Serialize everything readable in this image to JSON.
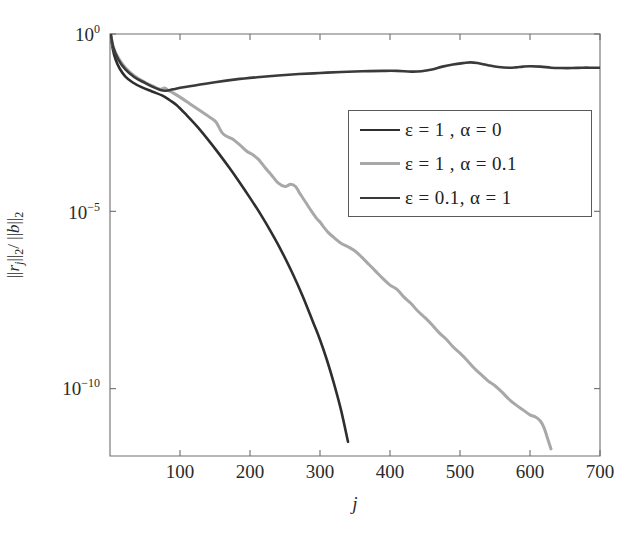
{
  "chart_data": {
    "type": "line",
    "title": "",
    "xlabel": "j",
    "ylabel": "|| r_j ||_2 / || b ||_2",
    "xlim": [
      0,
      700
    ],
    "ylim_log10": [
      -11.9,
      0
    ],
    "yscale": "log",
    "xscale": "linear",
    "grid": false,
    "legend_position": "center-right",
    "xticks": [
      "100",
      "200",
      "300",
      "400",
      "500",
      "600",
      "700"
    ],
    "xtick_values": [
      100,
      200,
      300,
      400,
      500,
      600,
      700
    ],
    "yticks": [
      "10^0",
      "10^-5",
      "10^-10"
    ],
    "ytick_exponents": [
      0,
      -5,
      -10
    ],
    "series": [
      {
        "name": "eps-1-alpha-0",
        "legend_label": "ε = 1 , α = 0",
        "color": "#2e2e2e",
        "width": 2.6,
        "x": [
          1,
          4,
          8,
          14,
          22,
          32,
          45,
          60,
          75,
          85,
          95,
          110,
          125,
          140,
          155,
          170,
          185,
          200,
          215,
          230,
          245,
          260,
          275,
          290,
          300,
          310,
          320,
          330,
          340,
          345
        ],
        "y_log10": [
          0,
          -0.42,
          -0.72,
          -0.98,
          -1.2,
          -1.36,
          -1.5,
          -1.62,
          -1.74,
          -1.86,
          -2.0,
          -2.3,
          -2.62,
          -2.98,
          -3.36,
          -3.76,
          -4.18,
          -4.62,
          -5.08,
          -5.58,
          -6.12,
          -6.72,
          -7.38,
          -8.12,
          -8.62,
          -9.2,
          -9.86,
          -10.6,
          -11.5,
          -11.95
        ]
      },
      {
        "name": "eps-1-alpha-0p1",
        "legend_label": "ε = 1 , α = 0.1",
        "color": "#a8a8a8",
        "width": 3.0,
        "x": [
          1,
          5,
          12,
          22,
          35,
          50,
          62,
          72,
          78,
          84,
          90,
          100,
          115,
          130,
          145,
          152,
          160,
          168,
          175,
          185,
          195,
          200,
          205,
          210,
          215,
          222,
          230,
          240,
          250,
          258,
          265,
          272,
          280,
          288,
          296,
          300,
          306,
          312,
          320,
          330,
          340,
          350,
          360,
          370,
          380,
          390,
          400,
          410,
          420,
          430,
          440,
          450,
          460,
          470,
          480,
          490,
          500,
          510,
          520,
          530,
          540,
          550,
          560,
          570,
          580,
          590,
          600,
          608,
          615,
          620,
          625,
          630,
          635
        ],
        "y_log10": [
          0,
          -0.38,
          -0.68,
          -0.95,
          -1.18,
          -1.36,
          -1.48,
          -1.56,
          -1.52,
          -1.6,
          -1.66,
          -1.78,
          -1.98,
          -2.18,
          -2.38,
          -2.5,
          -2.78,
          -2.9,
          -2.96,
          -3.12,
          -3.3,
          -3.36,
          -3.42,
          -3.5,
          -3.6,
          -3.78,
          -3.96,
          -4.2,
          -4.3,
          -4.24,
          -4.3,
          -4.52,
          -4.76,
          -5.0,
          -5.22,
          -5.3,
          -5.46,
          -5.6,
          -5.74,
          -5.9,
          -6.0,
          -6.12,
          -6.3,
          -6.5,
          -6.7,
          -6.9,
          -7.08,
          -7.2,
          -7.42,
          -7.6,
          -7.82,
          -8.0,
          -8.2,
          -8.42,
          -8.6,
          -8.82,
          -9.0,
          -9.2,
          -9.42,
          -9.6,
          -9.78,
          -9.92,
          -10.1,
          -10.3,
          -10.46,
          -10.6,
          -10.74,
          -10.8,
          -10.92,
          -11.1,
          -11.4,
          -11.7,
          -11.95
        ]
      },
      {
        "name": "eps-0p1-alpha-1",
        "legend_label": "ε = 0.1, α = 1",
        "color": "#3a3a3a",
        "width": 2.6,
        "x": [
          1,
          5,
          12,
          22,
          35,
          50,
          62,
          72,
          80,
          90,
          105,
          125,
          150,
          180,
          210,
          240,
          270,
          300,
          330,
          360,
          390,
          410,
          430,
          445,
          460,
          475,
          490,
          505,
          515,
          525,
          540,
          555,
          570,
          580,
          590,
          600,
          615,
          630,
          645,
          660,
          675,
          690,
          700
        ],
        "y_log10": [
          0,
          -0.4,
          -0.72,
          -1.0,
          -1.22,
          -1.38,
          -1.5,
          -1.58,
          -1.6,
          -1.56,
          -1.5,
          -1.44,
          -1.36,
          -1.28,
          -1.22,
          -1.17,
          -1.13,
          -1.1,
          -1.07,
          -1.05,
          -1.04,
          -1.04,
          -1.06,
          -1.05,
          -1.0,
          -0.92,
          -0.86,
          -0.82,
          -0.8,
          -0.82,
          -0.88,
          -0.93,
          -0.95,
          -0.94,
          -0.92,
          -0.91,
          -0.92,
          -0.95,
          -0.96,
          -0.96,
          -0.95,
          -0.95,
          -0.95
        ]
      }
    ]
  },
  "axes": {
    "ylabel_parts": {
      "open": "||",
      "r": "r",
      "r_sub": "j",
      "mid": "||",
      "mid_sub": "2",
      "slash": "/ ||",
      "b": "b",
      "close": "||",
      "close_sub": "2"
    },
    "xlabel_text": "j"
  },
  "legend": {
    "entries": [
      {
        "label": "ε = 1 , α = 0",
        "color": "#2e2e2e",
        "thickness": "2.6px"
      },
      {
        "label": "ε = 1 , α = 0.1",
        "color": "#a8a8a8",
        "thickness": "3px"
      },
      {
        "label": "ε = 0.1, α = 1",
        "color": "#3a3a3a",
        "thickness": "2.6px"
      }
    ]
  },
  "caption": {
    "partial_text": ""
  },
  "style": {
    "background": "#ffffff",
    "axis_color": "#6e6e6e",
    "text_color": "#2b2b2b"
  }
}
